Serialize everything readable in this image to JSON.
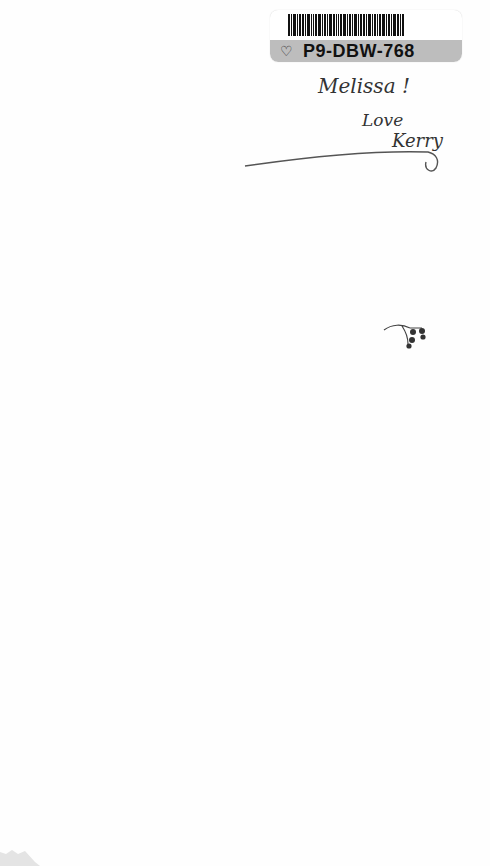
{
  "sticker": {
    "code": "P9-DBW-768",
    "icon": "heart-outline-icon"
  },
  "inscription": {
    "line1": "Happy ...",
    "name": "Melissa !",
    "closing": "Love",
    "signature": "Kerry"
  },
  "decoration": {
    "ornament": "berry-sprig-icon"
  }
}
